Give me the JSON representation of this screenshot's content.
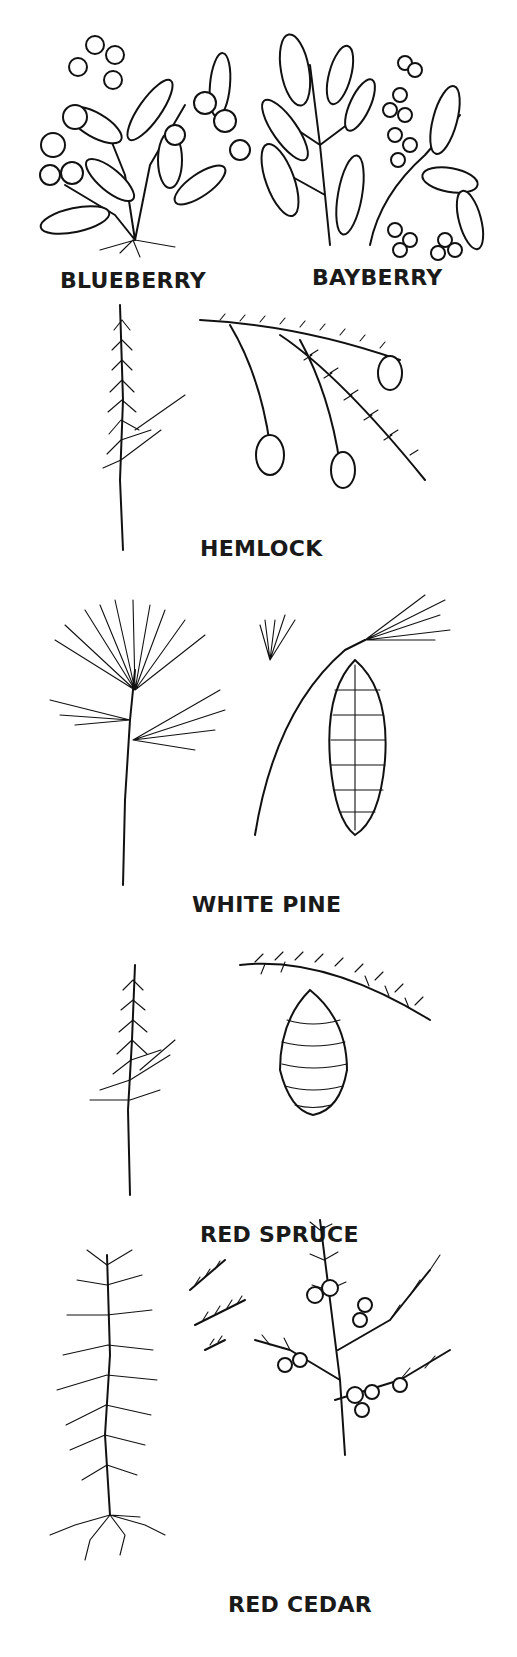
{
  "figure": {
    "ink_color": "#111111",
    "background_color": "#ffffff"
  },
  "plants": [
    {
      "id": "blueberry",
      "label": "BLUEBERRY",
      "drawings": [
        "branch-with-berries"
      ]
    },
    {
      "id": "bayberry",
      "label": "BAYBERRY",
      "drawings": [
        "branch-with-berry-clusters"
      ]
    },
    {
      "id": "hemlock",
      "label": "HEMLOCK",
      "drawings": [
        "sprig",
        "branch-with-cones"
      ]
    },
    {
      "id": "white-pine",
      "label": "WHITE PINE",
      "drawings": [
        "needle-bundles-twig",
        "branch-with-cone"
      ]
    },
    {
      "id": "red-spruce",
      "label": "RED SPRUCE",
      "drawings": [
        "sprig",
        "branch-with-hanging-cone"
      ]
    },
    {
      "id": "red-cedar",
      "label": "RED CEDAR",
      "drawings": [
        "seedling-with-roots",
        "foliage-detail",
        "branch-with-berries"
      ]
    }
  ]
}
